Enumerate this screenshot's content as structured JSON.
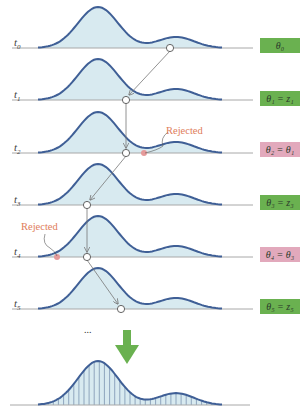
{
  "colors": {
    "curve_stroke": "#3f5f96",
    "curve_fill": "#d8eaf0",
    "baseline": "#a8a8a8",
    "accepted_badge": "#6ab150",
    "rejected_badge": "#e2a9bc",
    "rejected_text": "#e07d5a",
    "rejected_marker": "#e59a9a",
    "arrow_big": "#6ab150",
    "proposal_arrow": "#777777"
  },
  "rows": [
    {
      "label_base": "t",
      "label_sub": "0",
      "badge": "θ₀",
      "status": "accepted",
      "baseline_y": 48
    },
    {
      "label_base": "t",
      "label_sub": "1",
      "badge": "θ₁ = z₁",
      "status": "accepted",
      "baseline_y": 100
    },
    {
      "label_base": "t",
      "label_sub": "2",
      "badge": "θ₂ = θ₁",
      "status": "rejected",
      "baseline_y": 153
    },
    {
      "label_base": "t",
      "label_sub": "3",
      "badge": "θ₃ = z₃",
      "status": "accepted",
      "baseline_y": 205
    },
    {
      "label_base": "t",
      "label_sub": "4",
      "badge": "θ₄ = θ₃",
      "status": "rejected",
      "baseline_y": 257
    },
    {
      "label_base": "t",
      "label_sub": "5",
      "badge": "θ₅ = z₅",
      "status": "accepted",
      "baseline_y": 309
    }
  ],
  "annotations": {
    "rejected_1": "Rejected",
    "rejected_2": "Rejected",
    "ellipsis": "..."
  },
  "samples": {
    "current_x": [
      170,
      126,
      126,
      87,
      87,
      121
    ],
    "rejected_proposals": [
      {
        "row": 2,
        "x": 144
      },
      {
        "row": 4,
        "x": 57
      }
    ]
  },
  "histogram": {
    "baseline_y": 405,
    "bin_count": 36,
    "description": "Accumulated samples approximate the bimodal target distribution"
  }
}
